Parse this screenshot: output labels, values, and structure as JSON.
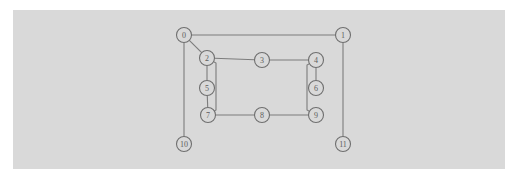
{
  "figure": {
    "background_color": "#ffffff",
    "panel_color": "#d9d9d9",
    "node_fill": "#d9d9d9",
    "node_stroke": "#6f6f6f",
    "edge_color": "#7c7c7c",
    "label_color": "#5d5d5d"
  },
  "chart_data": {
    "type": "diagram",
    "diagram_kind": "node-link-graph",
    "title": "",
    "xlabel": "",
    "ylabel": "",
    "grid": false,
    "legend": null,
    "node_radius": 7.5,
    "nodes": [
      {
        "id": "0",
        "label": "0",
        "x": 184,
        "y": 35
      },
      {
        "id": "1",
        "label": "1",
        "x": 343,
        "y": 35
      },
      {
        "id": "2",
        "label": "2",
        "x": 207,
        "y": 58
      },
      {
        "id": "3",
        "label": "3",
        "x": 262,
        "y": 60
      },
      {
        "id": "4",
        "label": "4",
        "x": 316,
        "y": 60
      },
      {
        "id": "5",
        "label": "5",
        "x": 207,
        "y": 88
      },
      {
        "id": "6",
        "label": "6",
        "x": 316,
        "y": 88
      },
      {
        "id": "7",
        "label": "7",
        "x": 208,
        "y": 115
      },
      {
        "id": "8",
        "label": "8",
        "x": 262,
        "y": 115
      },
      {
        "id": "9",
        "label": "9",
        "x": 316,
        "y": 115
      },
      {
        "id": "10",
        "label": "10",
        "x": 184,
        "y": 144
      },
      {
        "id": "11",
        "label": "11",
        "x": 343,
        "y": 144
      }
    ],
    "edges": [
      {
        "source": "0",
        "target": "1"
      },
      {
        "source": "0",
        "target": "2"
      },
      {
        "source": "0",
        "target": "10"
      },
      {
        "source": "2",
        "target": "3"
      },
      {
        "source": "2",
        "target": "5"
      },
      {
        "source": "3",
        "target": "4"
      },
      {
        "source": "4",
        "target": "6"
      },
      {
        "source": "5",
        "target": "7"
      },
      {
        "source": "7",
        "target": "8"
      },
      {
        "source": "8",
        "target": "9"
      },
      {
        "source": "1",
        "target": "11"
      }
    ],
    "polyline_edges": [
      {
        "id": "edge-2-7-elbow",
        "source": "2",
        "target": "7",
        "points": [
          [
            207,
            58
          ],
          [
            216,
            63
          ],
          [
            216,
            110
          ],
          [
            208,
            115
          ]
        ]
      },
      {
        "id": "edge-9-4-elbow",
        "source": "9",
        "target": "4",
        "points": [
          [
            316,
            115
          ],
          [
            307,
            110
          ],
          [
            307,
            65
          ],
          [
            316,
            60
          ]
        ]
      }
    ]
  }
}
